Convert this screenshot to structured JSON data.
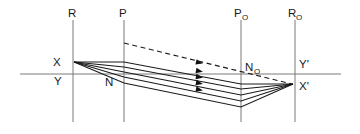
{
  "figure": {
    "type": "optical-ray-diagram",
    "background_color": "#ffffff",
    "ray_color": "#1a1a1a",
    "guide_color": "#7a7a7a"
  },
  "labels": {
    "plane_r": "R",
    "plane_p": "P",
    "plane_p_o_main": "P",
    "plane_p_o_sub": "O",
    "plane_r_o_main": "R",
    "plane_r_o_sub": "O",
    "point_x": "X",
    "point_y": "Y",
    "point_n": "N",
    "point_n_o_main": "N",
    "point_n_o_sub": "O",
    "point_y_prime": "Y'",
    "point_x_prime": "X'"
  },
  "geometry": {
    "axis": {
      "x1": 20,
      "y1": 74,
      "x2": 341,
      "y2": 74
    },
    "planes": [
      {
        "name": "R",
        "x": 73,
        "y1": 20,
        "y2": 122
      },
      {
        "name": "P",
        "x": 124,
        "y1": 20,
        "y2": 122
      },
      {
        "name": "PO",
        "x": 241,
        "y1": 20,
        "y2": 122
      },
      {
        "name": "RO",
        "x": 295,
        "y1": 20,
        "y2": 122
      }
    ],
    "object_point": {
      "name": "X",
      "x": 74,
      "y": 62
    },
    "image_point": {
      "name": "X'",
      "x": 293,
      "y": 84
    },
    "rays": [
      {
        "id": "ray-1",
        "mid_x": 124,
        "mid_y": 62,
        "far_x": 241,
        "far_y": 84
      },
      {
        "id": "ray-2",
        "mid_x": 124,
        "mid_y": 67,
        "far_x": 241,
        "far_y": 89
      },
      {
        "id": "ray-3",
        "mid_x": 124,
        "mid_y": 72,
        "far_x": 241,
        "far_y": 95
      },
      {
        "id": "ray-4",
        "mid_x": 124,
        "mid_y": 77,
        "far_x": 241,
        "far_y": 101
      },
      {
        "id": "ray-5",
        "mid_x": 124,
        "mid_y": 83,
        "far_x": 241,
        "far_y": 107
      }
    ],
    "dashed_ray": {
      "x1": 124,
      "y1": 43,
      "x2": 292,
      "y2": 84
    },
    "arrow_marks": [
      {
        "on": "dashed-ray",
        "x": 196,
        "y": 61.8,
        "angle": 13.7
      },
      {
        "on": "ray-2",
        "x": 196,
        "y": 70.5,
        "angle": 10.6
      },
      {
        "on": "ray-3",
        "x": 196,
        "y": 76.5,
        "angle": 11.1
      },
      {
        "on": "ray-4",
        "x": 196,
        "y": 82.5,
        "angle": 11.6
      },
      {
        "on": "ray-5",
        "x": 196,
        "y": 89.0,
        "angle": 11.6
      }
    ]
  },
  "label_positions": {
    "plane_r": {
      "x": 68,
      "y": 17
    },
    "plane_p": {
      "x": 119,
      "y": 17
    },
    "plane_p_o": {
      "x": 234,
      "y": 17
    },
    "plane_r_o": {
      "x": 288,
      "y": 17
    },
    "point_x": {
      "x": 53,
      "y": 66
    },
    "point_y": {
      "x": 54,
      "y": 85
    },
    "point_n": {
      "x": 105,
      "y": 86
    },
    "point_n_o": {
      "x": 245,
      "y": 71
    },
    "point_y_prime": {
      "x": 299,
      "y": 68
    },
    "point_x_prime": {
      "x": 299,
      "y": 90
    }
  }
}
